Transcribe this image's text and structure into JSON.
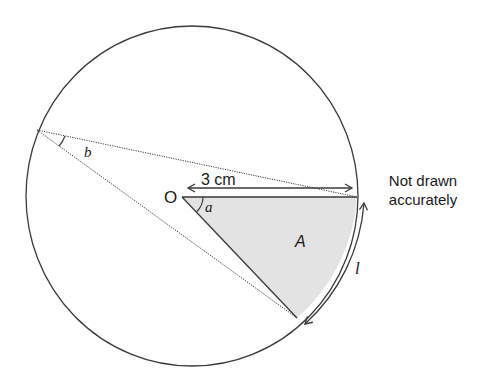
{
  "diagram": {
    "labels": {
      "centre": "O",
      "radius": "3 cm",
      "angle_centre": "a",
      "angle_circumference": "b",
      "sector_area": "A",
      "arc_length": "l"
    },
    "note_line1": "Not drawn",
    "note_line2": "accurately",
    "colors": {
      "stroke": "#3a3a3a",
      "sector_fill": "#e3e3e3",
      "background": "#ffffff"
    }
  }
}
